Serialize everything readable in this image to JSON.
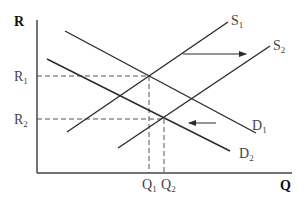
{
  "diagram": {
    "type": "supply-demand",
    "axes": {
      "y_label": "R",
      "x_label": "Q",
      "origin": [
        37,
        173
      ],
      "y_top": 20,
      "x_right": 292
    },
    "price_levels": [
      {
        "id": "R1",
        "base": "R",
        "sub": "1",
        "y": 76
      },
      {
        "id": "R2",
        "base": "R",
        "sub": "2",
        "y": 119
      }
    ],
    "quantity_levels": [
      {
        "id": "Q1",
        "base": "Q",
        "sub": "1",
        "x": 149
      },
      {
        "id": "Q2",
        "base": "Q",
        "sub": "2",
        "x": 164
      }
    ],
    "curves": [
      {
        "id": "S1",
        "base": "S",
        "sub": "1",
        "kind": "supply",
        "from": [
          67,
          132
        ],
        "to": [
          228,
          22
        ],
        "label_pos": [
          231,
          25
        ]
      },
      {
        "id": "S2",
        "base": "S",
        "sub": "2",
        "kind": "supply",
        "from": [
          118,
          148
        ],
        "to": [
          270,
          46
        ],
        "label_pos": [
          273,
          50
        ]
      },
      {
        "id": "D1",
        "base": "D",
        "sub": "1",
        "kind": "demand",
        "from": [
          65,
          31
        ],
        "to": [
          256,
          133
        ],
        "label_pos": [
          252,
          130
        ]
      },
      {
        "id": "D2",
        "base": "D",
        "sub": "2",
        "kind": "demand",
        "from": [
          47,
          59
        ],
        "to": [
          230,
          151
        ],
        "label_pos": [
          239,
          158
        ]
      }
    ],
    "shifts": [
      {
        "id": "supply-shift-arrow",
        "direction": "right",
        "from": [
          183,
          54
        ],
        "to": [
          246,
          54
        ]
      },
      {
        "id": "demand-shift-arrow",
        "direction": "left",
        "from": [
          216,
          123
        ],
        "to": [
          189,
          123
        ]
      }
    ],
    "equilibria": [
      {
        "id": "E1",
        "point": [
          149,
          76
        ],
        "price": "R1",
        "quantity": "Q1"
      },
      {
        "id": "E2",
        "point": [
          164,
          119
        ],
        "price": "R2",
        "quantity": "Q2"
      }
    ],
    "colors": {
      "line": "#2b2b2b",
      "dashed": "#555555",
      "label": "#444444"
    }
  }
}
